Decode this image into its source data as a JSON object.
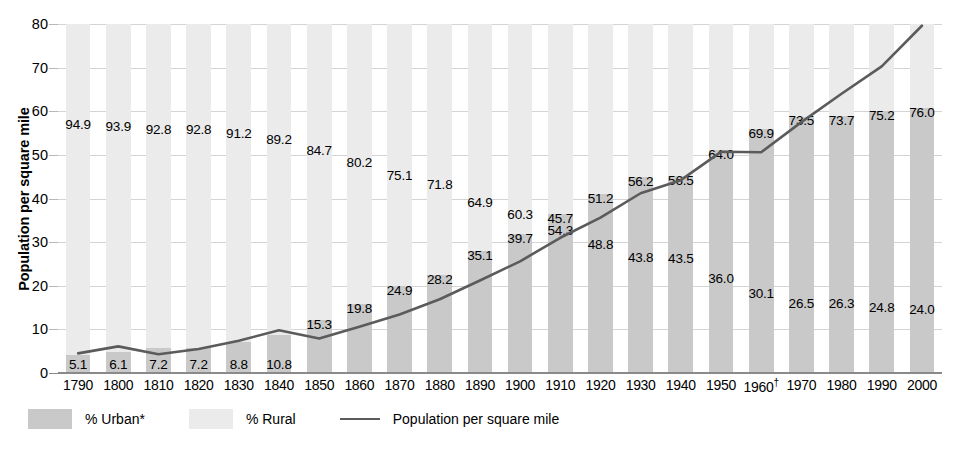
{
  "chart_data": {
    "type": "bar",
    "title": "",
    "subtitle": "",
    "xlabel": "",
    "ylabel": "Population per square mile",
    "ylim": [
      0,
      80
    ],
    "yticks": [
      0,
      10,
      20,
      30,
      40,
      50,
      60,
      70,
      80
    ],
    "grid": true,
    "legend_position": "bottom-left",
    "categories": [
      "1790",
      "1800",
      "1810",
      "1820",
      "1830",
      "1840",
      "1850",
      "1860",
      "1870",
      "1880",
      "1890",
      "1900",
      "1910",
      "1920",
      "1930",
      "1940",
      "1950",
      "1960†",
      "1970",
      "1980",
      "1990",
      "2000"
    ],
    "series": [
      {
        "name": "% Urban*",
        "type": "bar-stacked",
        "color": "#c9c9c9",
        "values": [
          5.1,
          6.1,
          7.2,
          7.2,
          8.8,
          10.8,
          15.3,
          19.8,
          24.9,
          28.2,
          35.1,
          39.7,
          45.7,
          51.2,
          56.2,
          56.5,
          64.0,
          69.9,
          73.5,
          73.7,
          75.2,
          76.0
        ]
      },
      {
        "name": "% Rural",
        "type": "bar-stacked",
        "color": "#ebebeb",
        "values": [
          94.9,
          93.9,
          92.8,
          92.8,
          91.2,
          89.2,
          84.7,
          80.2,
          75.1,
          71.8,
          64.9,
          60.3,
          54.3,
          48.8,
          43.8,
          43.5,
          36.0,
          30.1,
          26.5,
          26.3,
          24.8,
          24.0
        ]
      },
      {
        "name": "Population per square mile",
        "type": "line",
        "color": "#5b5b5b",
        "values": [
          4.5,
          6.1,
          4.3,
          5.5,
          7.4,
          9.8,
          7.9,
          10.6,
          13.4,
          16.9,
          21.2,
          25.6,
          31.0,
          35.6,
          41.2,
          44.2,
          50.7,
          50.6,
          57.5,
          64.0,
          70.3,
          79.6
        ]
      }
    ],
    "footnote_marker": "†"
  },
  "legend": {
    "urban_label": "% Urban*",
    "rural_label": "% Rural",
    "line_label": "Population per square mile"
  }
}
